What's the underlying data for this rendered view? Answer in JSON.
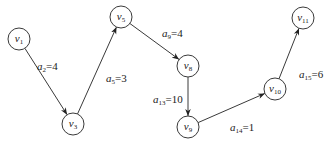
{
  "diagram": {
    "type": "directed-path-graph",
    "nodes": [
      {
        "id": "v1",
        "base": "v",
        "sub": "1",
        "x": 19,
        "y": 39
      },
      {
        "id": "v3",
        "base": "v",
        "sub": "3",
        "x": 73,
        "y": 124
      },
      {
        "id": "v5",
        "base": "v",
        "sub": "5",
        "x": 121,
        "y": 17
      },
      {
        "id": "v8",
        "base": "v",
        "sub": "8",
        "x": 188,
        "y": 66
      },
      {
        "id": "v9",
        "base": "v",
        "sub": "9",
        "x": 188,
        "y": 127
      },
      {
        "id": "v10",
        "base": "v",
        "sub": "10",
        "x": 275,
        "y": 89
      },
      {
        "id": "v11",
        "base": "v",
        "sub": "11",
        "x": 303,
        "y": 18
      }
    ],
    "edges": [
      {
        "from": "v1",
        "to": "v3",
        "base": "a",
        "sub": "2",
        "value": "=4",
        "lx": 37,
        "ly": 70
      },
      {
        "from": "v3",
        "to": "v5",
        "base": "a",
        "sub": "5",
        "value": "=3",
        "lx": 106,
        "ly": 82
      },
      {
        "from": "v5",
        "to": "v8",
        "base": "a",
        "sub": "9",
        "value": "=4",
        "lx": 162,
        "ly": 37
      },
      {
        "from": "v8",
        "to": "v9",
        "base": "a",
        "sub": "13",
        "value": "=10",
        "lx": 153,
        "ly": 103
      },
      {
        "from": "v9",
        "to": "v10",
        "base": "a",
        "sub": "14",
        "value": "=1",
        "lx": 230,
        "ly": 131
      },
      {
        "from": "v10",
        "to": "v11",
        "base": "a",
        "sub": "15",
        "value": "=6",
        "lx": 299,
        "ly": 78
      }
    ]
  }
}
